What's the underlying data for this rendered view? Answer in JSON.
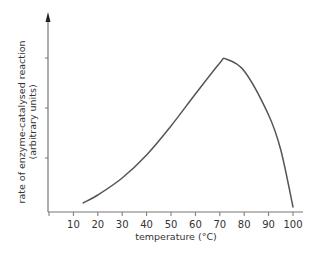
{
  "chart_data": {
    "type": "line",
    "title": "",
    "xlabel": "temperature (°C)",
    "ylabel_line1": "rate of enzyme-catalysed reaction",
    "ylabel_line2": "(arbitrary units)",
    "xlim": [
      0,
      105
    ],
    "ylim": [
      0,
      4
    ],
    "x_ticks": [
      0,
      10,
      20,
      30,
      40,
      50,
      60,
      70,
      80,
      90,
      100
    ],
    "x_tick_labels": [
      "",
      "10",
      "20",
      "30",
      "40",
      "50",
      "60",
      "70",
      "80",
      "90",
      "100"
    ],
    "y_ticks": [
      1,
      2,
      3
    ],
    "y_tick_labels": [
      "",
      "",
      ""
    ],
    "grid": false,
    "legend": null,
    "series": [
      {
        "name": "enzyme reaction rate",
        "color": "#555555",
        "x": [
          14,
          20,
          30,
          40,
          50,
          60,
          70,
          72.5,
          80,
          90,
          95,
          100
        ],
        "y": [
          0.18,
          0.34,
          0.68,
          1.14,
          1.72,
          2.36,
          2.98,
          3.06,
          2.82,
          1.94,
          1.24,
          0.1
        ]
      }
    ],
    "annotations": [
      "y-axis drawn with arrowhead",
      "peak (optimum) at about 72 °C"
    ]
  }
}
